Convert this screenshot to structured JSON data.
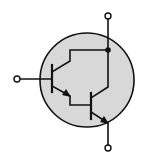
{
  "diagram": {
    "colors": {
      "background": "#ffffff",
      "envelope_fill": "#d8d8d8",
      "stroke": "#111111",
      "terminal_fill": "#ffffff"
    },
    "envelope": {
      "cx": 87,
      "cy": 80,
      "r": 47
    },
    "terminals": [
      {
        "id": "base",
        "cx": 17,
        "cy": 79
      },
      {
        "id": "collector",
        "cx": 108,
        "cy": 16
      },
      {
        "id": "emitter",
        "cx": 108,
        "cy": 148
      }
    ],
    "junction": {
      "cx": 108,
      "cy": 50
    }
  }
}
